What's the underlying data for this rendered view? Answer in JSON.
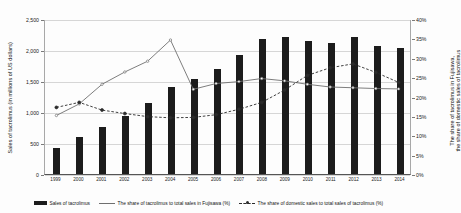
{
  "chart_data": {
    "type": "bar",
    "title": "",
    "subtitle": "",
    "xlabel": "",
    "ylabel": "Sales of tacrolimus (in millions of US dollars)",
    "ylabel_right": "The share of tacrolimus in Fujisawa, the share of domestic sales of tacrolimus",
    "categories": [
      "1999",
      "2000",
      "2001",
      "2002",
      "2003",
      "2004",
      "2005",
      "2006",
      "2007",
      "2008",
      "2009",
      "2010",
      "2011",
      "2012",
      "2013",
      "2014"
    ],
    "ylim": [
      0,
      2500
    ],
    "ylim_right": [
      0,
      40
    ],
    "y_ticks": [
      "0",
      "500",
      "1,000",
      "1,500",
      "2,000",
      "2,500"
    ],
    "y_ticks_right": [
      "0%",
      "5%",
      "10%",
      "15%",
      "20%",
      "25%",
      "30%",
      "35%",
      "40%"
    ],
    "grid": true,
    "legend_position": "bottom",
    "series": [
      {
        "name": "Sales of tacrolimus",
        "type": "bar",
        "axis": "left",
        "color": "#1c1c1c",
        "values": [
          425,
          600,
          760,
          930,
          1140,
          1400,
          1540,
          1700,
          1920,
          2180,
          2210,
          2140,
          2120,
          2210,
          2060,
          2040
        ]
      },
      {
        "name": "The share of tacrolimus to total sales in Fujisawa (%)",
        "type": "line",
        "axis": "right",
        "color": "#6f6f6f",
        "style": "solid",
        "values": [
          15.2,
          18.2,
          23.3,
          26.5,
          29.3,
          34.8,
          22.0,
          23.5,
          24.0,
          24.8,
          24.2,
          23.3,
          22.6,
          22.4,
          22.2,
          22.1
        ]
      },
      {
        "name": "The share of domestic sales to total sales of tacrolimus (%)",
        "type": "line",
        "axis": "right",
        "color": "#2b2b2b",
        "style": "dashed",
        "values": [
          17.3,
          18.6,
          16.6,
          15.7,
          14.9,
          14.6,
          14.7,
          15.4,
          16.8,
          18.6,
          21.8,
          25.6,
          27.6,
          28.6,
          26.4,
          23.8
        ]
      }
    ]
  },
  "legend": {
    "items": [
      {
        "label": "Sales of tacrolimus",
        "marker": "bar-swatch"
      },
      {
        "label": "The share of tacrolimus to total sales in Fujisawa (%)",
        "marker": "solid-line-swatch"
      },
      {
        "label": "The share of domestic sales to total sales of tacrolimus (%)",
        "marker": "dashed-line-swatch"
      }
    ]
  }
}
